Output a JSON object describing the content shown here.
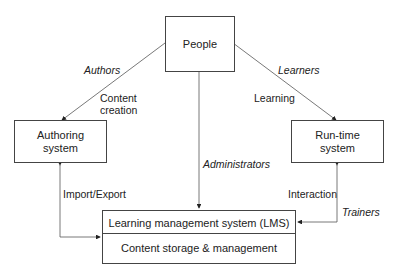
{
  "nodes": {
    "people": "People",
    "authoring": [
      "Authoring",
      "system"
    ],
    "runtime": [
      "Run-time",
      "system"
    ],
    "lms_title": "Learning management system (LMS)",
    "lms_sub": "Content storage & management"
  },
  "edges": {
    "authors_role": "Authors",
    "authors_action": [
      "Content",
      "creation"
    ],
    "learners_role": "Learners",
    "learners_action": "Learning",
    "administrators_role": "Administrators",
    "import_export": "Import/Export",
    "interaction": "Interaction",
    "trainers_role": "Trainers"
  }
}
